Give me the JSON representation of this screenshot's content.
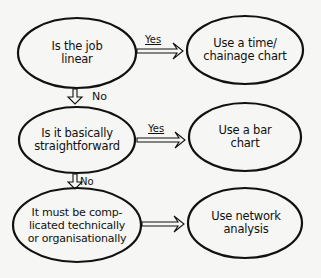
{
  "diagram": {
    "colors": {
      "background": "#f6f6f4",
      "stroke": "#111111"
    },
    "nodes": [
      {
        "id": "q1",
        "type": "decision",
        "text": "Is the job\nlinear"
      },
      {
        "id": "a1",
        "type": "outcome",
        "text": "Use a time/\nchainage chart"
      },
      {
        "id": "q2",
        "type": "decision",
        "text": "Is it basically\nstraightforward"
      },
      {
        "id": "a2",
        "type": "outcome",
        "text": "Use a bar\nchart"
      },
      {
        "id": "q3",
        "type": "decision",
        "text": "It must be comp-\nlicated technically\nor organisationally"
      },
      {
        "id": "a3",
        "type": "outcome",
        "text": "Use network\nanalysis"
      }
    ],
    "edges": [
      {
        "from": "q1",
        "to": "a1",
        "label": "Yes"
      },
      {
        "from": "q1",
        "to": "q2",
        "label": "No"
      },
      {
        "from": "q2",
        "to": "a2",
        "label": "Yes"
      },
      {
        "from": "q2",
        "to": "q3",
        "label": "No"
      },
      {
        "from": "q3",
        "to": "a3",
        "label": ""
      }
    ]
  }
}
